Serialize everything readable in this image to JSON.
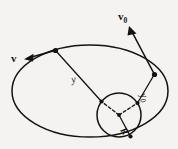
{
  "figure": {
    "background_color": "#f4f3f1",
    "ink_color": "#151311",
    "labels": {
      "velocity_current": "v",
      "velocity_initial_base": "v",
      "velocity_initial_sub": "0",
      "distance_current": "y",
      "distance_initial_base": "y",
      "distance_initial_sub": "0",
      "body_radius": "R"
    },
    "geometry": {
      "orbit": {
        "shape": "ellipse",
        "cx": 90,
        "cy": 91,
        "rx": 78,
        "ry": 46
      },
      "body": {
        "shape": "circle",
        "cx": 119,
        "cy": 115,
        "r": 22
      },
      "point_current": {
        "x": 55,
        "y": 50
      },
      "point_initial": {
        "x": 155,
        "y": 75
      },
      "surface_point_current": {
        "x": 100,
        "y": 101
      },
      "surface_point_initial": {
        "x": 138,
        "y": 105
      },
      "surface_point_radius": {
        "x": 130,
        "y": 136
      }
    }
  }
}
